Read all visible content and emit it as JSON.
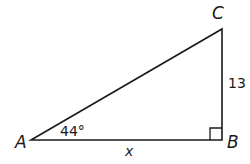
{
  "diagram": {
    "type": "right-triangle",
    "vertices": {
      "A": {
        "label": "A"
      },
      "B": {
        "label": "B"
      },
      "C": {
        "label": "C"
      }
    },
    "angle_A": {
      "label": "44°",
      "value_deg": 44
    },
    "right_angle_at": "B",
    "side_BC": {
      "label": "13",
      "value": 13
    },
    "side_AB": {
      "label": "x"
    },
    "colors": {
      "stroke": "#1a1a1a",
      "background": "#ffffff"
    }
  }
}
